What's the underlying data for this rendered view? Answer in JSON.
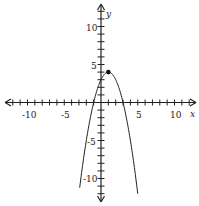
{
  "chart_data": {
    "type": "line",
    "title": "",
    "xlabel": "x",
    "ylabel": "y",
    "xlim": [
      -12,
      12
    ],
    "ylim": [
      -12,
      12
    ],
    "grid": false,
    "x_tick_labels": [
      "-10",
      "-5",
      "5",
      "10"
    ],
    "y_tick_labels": [
      "10",
      "5",
      "-5",
      "-10"
    ],
    "tick_interval": 1,
    "series": [
      {
        "name": "parabola",
        "equation": "y = -(x - 1)^2 + 4",
        "x_range": [
          -2.9,
          5
        ],
        "vertex": [
          1,
          4
        ],
        "x_intercepts": [
          -1,
          3
        ],
        "y_intercept": 3
      }
    ],
    "annotations": [
      {
        "type": "point",
        "x": 1,
        "y": 4,
        "label": "vertex"
      }
    ]
  },
  "labels": {
    "x_axis": "x",
    "y_axis": "y",
    "xt_m10": "-10",
    "xt_m5": "-5",
    "xt_5": "5",
    "xt_10": "10",
    "yt_10": "10",
    "yt_5": "5",
    "yt_m5": "-5",
    "yt_m10": "-10"
  },
  "colors": {
    "axis": "#222222",
    "curve": "#222222",
    "background": "#ffffff"
  }
}
